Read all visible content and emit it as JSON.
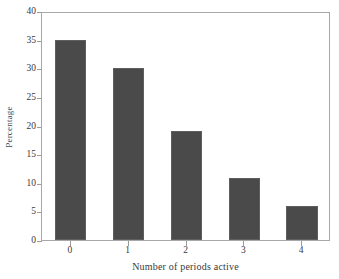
{
  "chart_data": {
    "type": "bar",
    "title": "",
    "xlabel": "Number of periods active",
    "ylabel": "Percentage",
    "categories": [
      "0",
      "1",
      "2",
      "3",
      "4"
    ],
    "values": [
      35,
      30,
      19,
      10.8,
      6
    ],
    "series": [
      {
        "name": "Percentage",
        "values": [
          35,
          30,
          19,
          10.8,
          6
        ]
      }
    ],
    "ylim": [
      0,
      40
    ],
    "xlim": [
      -0.5,
      4.5
    ],
    "ytick_values": [
      0,
      5,
      10,
      15,
      20,
      25,
      30,
      35,
      40
    ],
    "ytick_labels": [
      "0",
      "5",
      "10",
      "15",
      "20",
      "25",
      "30",
      "35",
      "40"
    ],
    "xtick_labels": [
      "0",
      "1",
      "2",
      "3",
      "4"
    ],
    "grid": false,
    "legend": false,
    "legend_position": "none",
    "bar_color": "#4a4a4a",
    "bar_edge_color": "#5e5e5e",
    "frame_color": "#a8a8a8",
    "background_color": "#ffffff",
    "text_color": "#3a3a3a"
  }
}
